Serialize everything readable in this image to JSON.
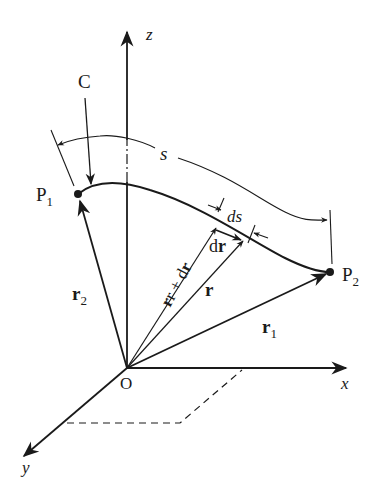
{
  "diagram": {
    "type": "vector-calculus-curve-diagram",
    "axes": {
      "z_label": "z",
      "x_label": "x",
      "y_label": "y",
      "origin_label": "O"
    },
    "curve": {
      "label": "C",
      "start_point": "P",
      "start_sub": "1",
      "end_point": "P",
      "end_sub": "2"
    },
    "arc_length": {
      "label": "s"
    },
    "differentials": {
      "ds_label": "ds",
      "dr_label_d": "d",
      "dr_label_r": "r"
    },
    "vectors": {
      "r2_main": "r",
      "r2_sub": "2",
      "r1_main": "r",
      "r1_sub": "1",
      "r_label": "r",
      "r_plus_dr_label": "r + d",
      "r_plus_dr_bold": "r"
    },
    "colors": {
      "ink": "#1a1a1a",
      "background": "#ffffff"
    }
  }
}
